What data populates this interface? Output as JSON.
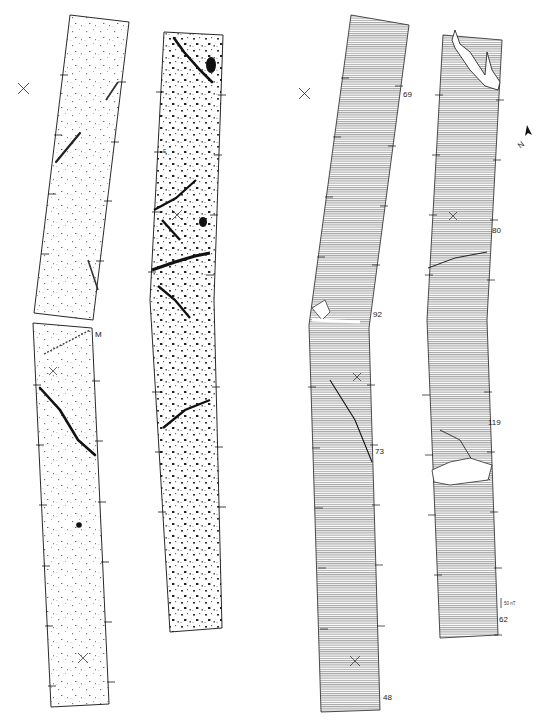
{
  "figure": {
    "colors": {
      "ink": "#111111",
      "background": "#ffffff",
      "hatch": "#555555"
    }
  },
  "greyscale_panels": {
    "letters": [
      {
        "id": "M",
        "text": "M"
      },
      {
        "id": "E",
        "text": "E"
      }
    ]
  },
  "trace_panels": {
    "strip1_labels": [
      "69",
      "92",
      "73",
      "48"
    ],
    "strip2_labels": [
      "80",
      "119",
      "62"
    ],
    "scale_bar": {
      "text": "50 nT"
    },
    "north_arrow": {
      "text": "N"
    }
  },
  "markers": {
    "cross_symbol": "×"
  }
}
